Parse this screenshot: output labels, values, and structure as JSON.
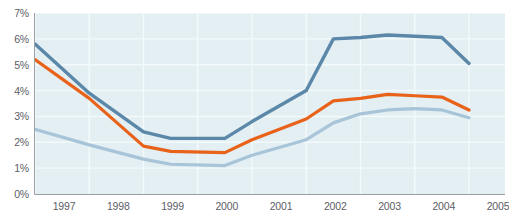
{
  "chart_data": {
    "type": "line",
    "title": "",
    "xlabel": "",
    "ylabel": "",
    "x": [
      1997,
      1998,
      1999,
      2000,
      2001,
      2002,
      2003,
      2004,
      2005
    ],
    "categories": [
      "1997",
      "1998",
      "1999",
      "2000",
      "2001",
      "2002",
      "2003",
      "2004",
      "2005"
    ],
    "xlim": [
      1997,
      2005
    ],
    "ylim": [
      0,
      7
    ],
    "ytick_labels": [
      "0%",
      "1%",
      "2%",
      "3%",
      "4%",
      "5%",
      "6%",
      "7%"
    ],
    "ytick_values": [
      0,
      1,
      2,
      3,
      4,
      5,
      6,
      7
    ],
    "grid": true,
    "legend": "none",
    "plot_background": "#e3eff3",
    "gridline_color": "#f4fafb",
    "axis_color": "#9aa0a6",
    "series": [
      {
        "name": "series-1",
        "color": "#5b87a8",
        "width": 3.4,
        "points": [
          {
            "x": 1997.0,
            "y": 5.8
          },
          {
            "x": 1998.0,
            "y": 3.9
          },
          {
            "x": 1999.0,
            "y": 2.4
          },
          {
            "x": 1999.5,
            "y": 2.15
          },
          {
            "x": 2000.5,
            "y": 2.15
          },
          {
            "x": 2001.0,
            "y": 2.8
          },
          {
            "x": 2002.0,
            "y": 4.0
          },
          {
            "x": 2002.5,
            "y": 6.0
          },
          {
            "x": 2003.0,
            "y": 6.05
          },
          {
            "x": 2003.5,
            "y": 6.15
          },
          {
            "x": 2004.0,
            "y": 6.1
          },
          {
            "x": 2004.5,
            "y": 6.05
          },
          {
            "x": 2005.0,
            "y": 5.05
          }
        ],
        "values": [
          5.8,
          3.9,
          2.4,
          2.15,
          2.8,
          4.0,
          6.05,
          6.1,
          5.05
        ]
      },
      {
        "name": "series-2",
        "color": "#e8621a",
        "width": 3.2,
        "points": [
          {
            "x": 1997.0,
            "y": 5.2
          },
          {
            "x": 1998.0,
            "y": 3.7
          },
          {
            "x": 1999.0,
            "y": 1.85
          },
          {
            "x": 1999.5,
            "y": 1.65
          },
          {
            "x": 2000.5,
            "y": 1.6
          },
          {
            "x": 2001.0,
            "y": 2.1
          },
          {
            "x": 2002.0,
            "y": 2.9
          },
          {
            "x": 2002.5,
            "y": 3.6
          },
          {
            "x": 2003.0,
            "y": 3.7
          },
          {
            "x": 2003.5,
            "y": 3.85
          },
          {
            "x": 2004.0,
            "y": 3.8
          },
          {
            "x": 2004.5,
            "y": 3.75
          },
          {
            "x": 2005.0,
            "y": 3.25
          }
        ],
        "values": [
          5.2,
          3.7,
          1.85,
          1.6,
          2.1,
          2.9,
          3.7,
          3.8,
          3.25
        ]
      },
      {
        "name": "series-3",
        "color": "#a8c4d8",
        "width": 3.2,
        "points": [
          {
            "x": 1997.0,
            "y": 2.5
          },
          {
            "x": 1998.0,
            "y": 1.9
          },
          {
            "x": 1999.0,
            "y": 1.35
          },
          {
            "x": 1999.5,
            "y": 1.15
          },
          {
            "x": 2000.5,
            "y": 1.1
          },
          {
            "x": 2001.0,
            "y": 1.5
          },
          {
            "x": 2002.0,
            "y": 2.1
          },
          {
            "x": 2002.5,
            "y": 2.75
          },
          {
            "x": 2003.0,
            "y": 3.1
          },
          {
            "x": 2003.5,
            "y": 3.25
          },
          {
            "x": 2004.0,
            "y": 3.3
          },
          {
            "x": 2004.5,
            "y": 3.25
          },
          {
            "x": 2005.0,
            "y": 2.95
          }
        ],
        "values": [
          2.5,
          1.9,
          1.35,
          1.1,
          1.5,
          2.1,
          3.1,
          3.3,
          2.95
        ]
      }
    ]
  }
}
